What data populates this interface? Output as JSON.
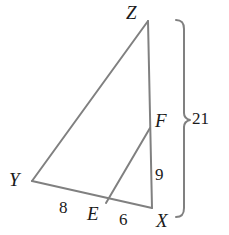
{
  "figure": {
    "kind": "geometry-diagram",
    "stroke_color": "#808080",
    "text_color": "#1a1a1a",
    "background_color": "#ffffff",
    "stroke_width": 2
  },
  "vertices": {
    "Z": {
      "label": "Z",
      "x": 148,
      "y": 21
    },
    "Y": {
      "label": "Y",
      "x": 32,
      "y": 181
    },
    "X": {
      "label": "X",
      "x": 152,
      "y": 208
    },
    "E": {
      "label": "E",
      "x": 106,
      "y": 203
    },
    "F": {
      "label": "F",
      "x": 150,
      "y": 128
    }
  },
  "segments": [
    {
      "name": "ZY",
      "from": "Z",
      "to": "Y"
    },
    {
      "name": "ZX",
      "from": "Z",
      "to": "X"
    },
    {
      "name": "YX",
      "from": "Y",
      "to": "X"
    },
    {
      "name": "EF",
      "from": "E",
      "to": "F"
    }
  ],
  "measures": {
    "YE": {
      "value": "8",
      "segment": "YE"
    },
    "EX": {
      "value": "6",
      "segment": "EX"
    },
    "FX": {
      "value": "9",
      "segment": "FX"
    },
    "ZX": {
      "value": "21",
      "segment": "ZX"
    }
  },
  "bracket": {
    "name": "brace-ZX",
    "label": "21",
    "top_y": 20,
    "bottom_y": 217,
    "spine_x": 184,
    "notch_y": 120,
    "orientation": "right"
  }
}
